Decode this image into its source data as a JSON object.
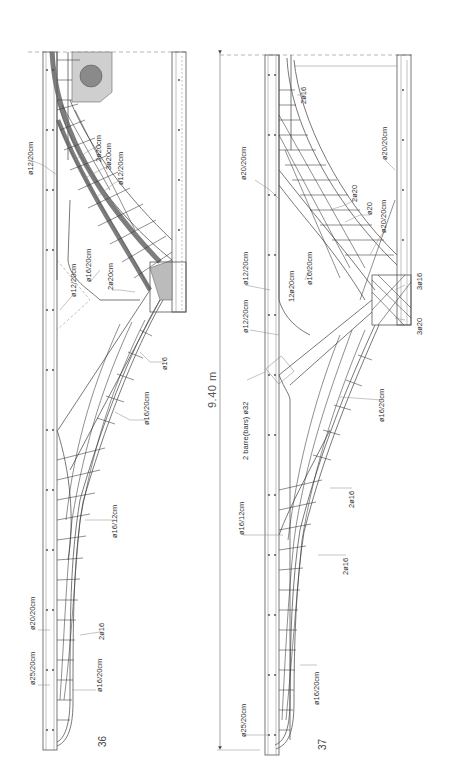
{
  "drawing": {
    "title": "Reinforcement details of cantilever deck sections",
    "dimension_label": "9.40 m",
    "colors": {
      "line": "#555555",
      "heavy_bar": "#555555",
      "fill_block": "#cccccc",
      "text": "#333333"
    }
  },
  "figure_36": {
    "number": "36",
    "labels": {
      "l1": "ø12/20cm",
      "l2": "2ø20cm",
      "l3": "3ø20cm",
      "l4": "ø12/20cm",
      "l5": "ø12/20cm",
      "l6": "ø16/20cm",
      "l7": "2ø20cm",
      "l8": "ø16",
      "l9": "ø16/20cm",
      "l10": "ø16/12cm",
      "l11": "ø20/20cm",
      "l12": "2ø16",
      "l13": "ø25/20cm",
      "l14": "ø16/20cm"
    }
  },
  "figure_37": {
    "number": "37",
    "labels": {
      "l1": "2ø16",
      "l2": "ø20/20cm",
      "l3": "ø20/20cm",
      "l4": "2ø20",
      "l5": "ø20",
      "l6": "ø20/20cm",
      "l7": "ø12/20cm",
      "l8": "12ø20cm",
      "l9": "ø16/20cm",
      "l10": "ø12/20cm",
      "l11": "3ø16",
      "l12": "3ø20",
      "l13": "2 barre(bars) ø32",
      "l14": "ø16/20cm",
      "l15": "2ø16",
      "l16": "ø16/12cm",
      "l17": "2ø16",
      "l18": "ø16/20cm",
      "l19": "ø25/20cm"
    }
  }
}
